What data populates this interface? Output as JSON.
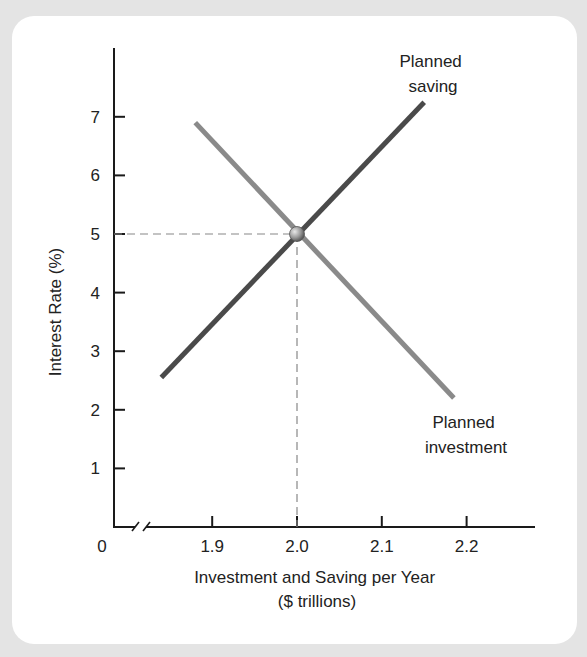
{
  "chart_data": {
    "type": "line",
    "title": "",
    "xlabel": "Investment and Saving per Year",
    "xlabel_line2": "($ trillions)",
    "ylabel": "Interest Rate (%)",
    "x_ticks": [
      "1.9",
      "2.0",
      "2.1",
      "2.2"
    ],
    "x_tick_values": [
      1.9,
      2.0,
      2.1,
      2.2
    ],
    "y_ticks": [
      "1",
      "2",
      "3",
      "4",
      "5",
      "6",
      "7"
    ],
    "y_tick_values": [
      1,
      2,
      3,
      4,
      5,
      6,
      7
    ],
    "origin_label": "0",
    "x_axis_break": true,
    "xlim": [
      1.78,
      2.28
    ],
    "ylim": [
      0,
      8
    ],
    "grid": false,
    "series": [
      {
        "name": "Planned saving",
        "label_line1": "Planned",
        "label_line2": "saving",
        "color": "#4a4a4a",
        "x": [
          1.84,
          2.15
        ],
        "y": [
          2.55,
          7.25
        ]
      },
      {
        "name": "Planned investment",
        "label_line1": "Planned",
        "label_line2": "investment",
        "color": "#8a8a8a",
        "x": [
          1.88,
          2.185
        ],
        "y": [
          6.9,
          2.2
        ]
      }
    ],
    "equilibrium": {
      "x": 2.0,
      "y": 5,
      "marker": "sphere",
      "guides": "dashed"
    }
  }
}
